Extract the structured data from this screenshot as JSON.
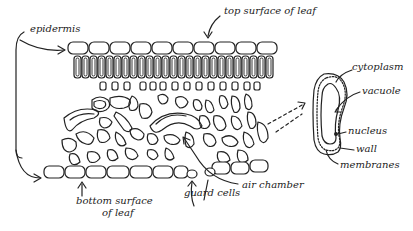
{
  "diagram": {
    "labels": {
      "epidermis": "epidermis",
      "top_surface": "top surface of leaf",
      "bottom_surface_line1": "bottom surface",
      "bottom_surface_line2": "of leaf",
      "guard_cells": "guard cells",
      "air_chamber": "air chamber",
      "cytoplasm": "cytoplasm",
      "vacuole": "vacuole",
      "nucleus": "nucleus",
      "wall": "wall",
      "membranes": "membranes"
    },
    "ink_color": "#222222",
    "background": "#ffffff"
  }
}
